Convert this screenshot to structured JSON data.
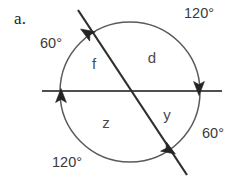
{
  "figure": {
    "item_label": "a.",
    "colors": {
      "stroke": "#4a4a4a",
      "chord_stroke": "#2e2e2e",
      "text": "#3a3a3a",
      "background": "#ffffff"
    },
    "circle": {
      "cx": 130,
      "cy": 92,
      "r": 70
    },
    "secant_horizontal": {
      "name": "horizontal-secant",
      "x1": 42,
      "y1": 91,
      "x2": 222,
      "y2": 91
    },
    "secant_diagonal": {
      "name": "diagonal-secant",
      "x1": 78,
      "y1": 10,
      "x2": 187,
      "y2": 175
    },
    "arrow_markers": [
      {
        "name": "arrow-upper-left",
        "x": 87,
        "y": 33,
        "rotation": -58
      },
      {
        "name": "arrow-left",
        "x": 61,
        "y": 96,
        "rotation": 0
      },
      {
        "name": "arrow-right",
        "x": 199,
        "y": 88,
        "rotation": 180
      },
      {
        "name": "arrow-lower-right",
        "x": 169,
        "y": 150,
        "rotation": 122
      }
    ],
    "arc_measures": [
      {
        "name": "arc-measure-top-right",
        "value": "120°",
        "x": 199,
        "y": 13
      },
      {
        "name": "arc-measure-top-left",
        "value": "60°",
        "x": 51,
        "y": 43
      },
      {
        "name": "arc-measure-bottom-right",
        "value": "60°",
        "x": 213,
        "y": 133
      },
      {
        "name": "arc-measure-bottom-left",
        "value": "120°",
        "x": 67,
        "y": 162
      }
    ],
    "region_labels": [
      {
        "name": "region-label-f",
        "value": "f",
        "x": 94,
        "y": 63
      },
      {
        "name": "region-label-d",
        "value": "d",
        "x": 152,
        "y": 57
      },
      {
        "name": "region-label-z",
        "value": "z",
        "x": 106,
        "y": 122
      },
      {
        "name": "region-label-y",
        "value": "y",
        "x": 167,
        "y": 114
      }
    ]
  }
}
